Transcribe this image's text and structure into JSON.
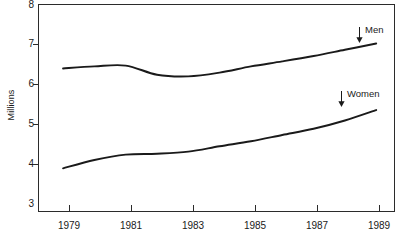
{
  "chart_data": {
    "type": "line",
    "title": "",
    "subtitle": "",
    "xlabel": "",
    "ylabel": "Millions",
    "xlim": [
      1978.2,
      1989.6
    ],
    "ylim": [
      3,
      8
    ],
    "grid": false,
    "legend_position": "inline-right-arrow-annotations",
    "y_ticks": [
      "8",
      "7",
      "6",
      "5",
      "4",
      "3"
    ],
    "y_tick_values": [
      8,
      7,
      6,
      5,
      4,
      3
    ],
    "x_ticks": [
      "1979",
      "1981",
      "1983",
      "1985",
      "1987",
      "1989"
    ],
    "x_tick_values": [
      1979,
      1981,
      1983,
      1985,
      1987,
      1989
    ],
    "x": [
      1979,
      1980,
      1981,
      1982,
      1983,
      1984,
      1985,
      1986,
      1987,
      1988,
      1989
    ],
    "series": [
      {
        "name": "Men",
        "label": "Men",
        "color": "#1a1a1a",
        "values": [
          6.45,
          6.5,
          6.52,
          6.3,
          6.26,
          6.35,
          6.5,
          6.62,
          6.75,
          6.9,
          7.05
        ]
      },
      {
        "name": "Women",
        "label": "Women",
        "color": "#1a1a1a",
        "values": [
          4.05,
          4.25,
          4.38,
          4.4,
          4.45,
          4.58,
          4.7,
          4.85,
          5.0,
          5.2,
          5.45
        ]
      }
    ],
    "annotations": [
      {
        "text": "Men",
        "marker": "down-arrow",
        "points_to_series": "Men",
        "near_year": 1988
      },
      {
        "text": "Women",
        "marker": "down-arrow",
        "points_to_series": "Women",
        "near_year": 1987
      }
    ]
  }
}
